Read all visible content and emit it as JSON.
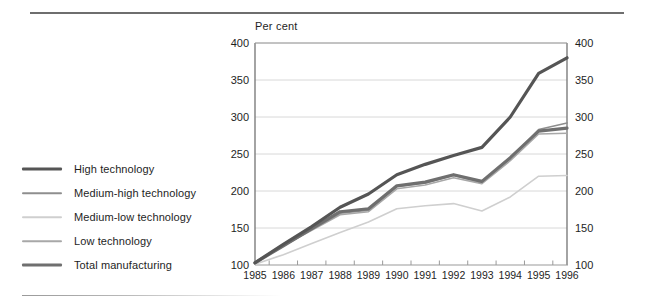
{
  "rules": {
    "top": "divider",
    "bottom": "divider-partial"
  },
  "legend": {
    "items": [
      {
        "label": "High technology",
        "color": "#555555",
        "width": 3.2
      },
      {
        "label": "Medium-high technology",
        "color": "#8e8e8e",
        "width": 1.6
      },
      {
        "label": "Medium-low technology",
        "color": "#cfcfcf",
        "width": 1.6
      },
      {
        "label": "Low technology",
        "color": "#a8a8a8",
        "width": 1.6
      },
      {
        "label": "Total manufacturing",
        "color": "#6f6f6f",
        "width": 3.2
      }
    ]
  },
  "chart_data": {
    "type": "line",
    "title": "",
    "unit_label": "Per cent",
    "xlabel": "",
    "ylabel": "Per cent",
    "ylim": [
      100,
      400
    ],
    "yticks": [
      100,
      150,
      200,
      250,
      300,
      350,
      400
    ],
    "ytick_labels_left": [
      "100",
      "150",
      "200",
      "250",
      "300",
      "350",
      "400"
    ],
    "ytick_labels_right": [
      "100",
      "150",
      "200",
      "250",
      "300",
      "350",
      "400"
    ],
    "grid": true,
    "legend_position": "left-outside",
    "x": [
      1985,
      1986,
      1987,
      1988,
      1989,
      1990,
      1991,
      1992,
      1993,
      1994,
      1995,
      1996
    ],
    "xtick_labels": [
      "1985",
      "1986",
      "1987",
      "1988",
      "1989",
      "1990",
      "1991",
      "1992",
      "1993",
      "1994",
      "1995",
      "1996"
    ],
    "series": [
      {
        "name": "High technology",
        "color": "#555555",
        "width": 3.2,
        "values": [
          103,
          128,
          152,
          178,
          196,
          222,
          236,
          248,
          259,
          300,
          359,
          380
        ]
      },
      {
        "name": "Medium-high technology",
        "color": "#8e8e8e",
        "width": 1.6,
        "values": [
          103,
          126,
          148,
          170,
          174,
          206,
          211,
          221,
          212,
          244,
          283,
          292
        ]
      },
      {
        "name": "Medium-low technology",
        "color": "#cfcfcf",
        "width": 1.6,
        "values": [
          101,
          114,
          129,
          144,
          158,
          176,
          180,
          183,
          173,
          192,
          220,
          221
        ]
      },
      {
        "name": "Low technology",
        "color": "#a8a8a8",
        "width": 1.6,
        "values": [
          103,
          126,
          147,
          168,
          172,
          203,
          208,
          218,
          210,
          241,
          277,
          278
        ]
      },
      {
        "name": "Total manufacturing",
        "color": "#6f6f6f",
        "width": 3.2,
        "values": [
          103,
          126,
          149,
          172,
          176,
          207,
          212,
          222,
          213,
          245,
          281,
          285
        ]
      }
    ]
  }
}
